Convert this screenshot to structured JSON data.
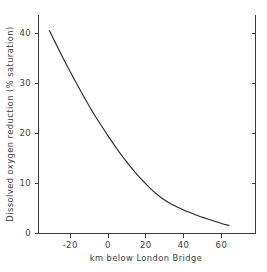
{
  "chart_data": {
    "type": "line",
    "title": "",
    "xlabel": "km below London Bridge",
    "ylabel": "Dissolved oxygen reduction (% saturation)",
    "xlim": [
      -40,
      75
    ],
    "ylim": [
      0,
      44
    ],
    "xticks": [
      -20,
      0,
      20,
      40,
      60
    ],
    "xtick_labels": [
      "-20",
      "0",
      "20",
      "40",
      "60"
    ],
    "yticks": [
      0,
      10,
      20,
      30,
      40
    ],
    "ytick_labels": [
      "0",
      "10",
      "20",
      "30",
      "40"
    ],
    "grid": false,
    "legend": null,
    "series": [
      {
        "name": "Dissolved oxygen reduction",
        "color": "#2b2b2b",
        "x": [
          -31,
          -28,
          -24,
          -20,
          -16,
          -12,
          -8,
          -4,
          0,
          4,
          8,
          12,
          16,
          20,
          24,
          28,
          32,
          36,
          40,
          44,
          48,
          52,
          56,
          60,
          64
        ],
        "y": [
          40.5,
          38.2,
          35.2,
          32.3,
          29.5,
          26.8,
          24.2,
          21.8,
          19.5,
          17.3,
          15.2,
          13.3,
          11.5,
          9.9,
          8.4,
          7.2,
          6.2,
          5.4,
          4.7,
          4.1,
          3.5,
          3.0,
          2.5,
          2.0,
          1.6
        ]
      }
    ]
  },
  "axes": {
    "spine_color": "#3a3a3a",
    "right_spine_visible": true,
    "top_spine_visible": false
  }
}
